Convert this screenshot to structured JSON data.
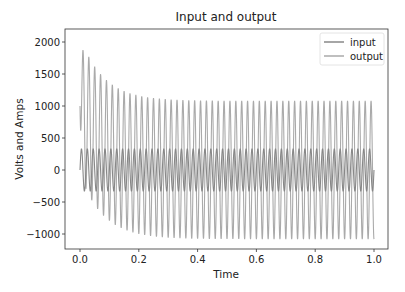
{
  "chart_data": {
    "type": "line",
    "title": "Input and output",
    "xlabel": "Time",
    "ylabel": "Volts and Amps",
    "xlim": [
      -0.05,
      1.05
    ],
    "ylim": [
      -1250,
      2200
    ],
    "xticks": [
      0.0,
      0.2,
      0.4,
      0.6,
      0.8,
      1.0
    ],
    "xtick_labels": [
      "0.0",
      "0.2",
      "0.4",
      "0.6",
      "0.8",
      "1.0"
    ],
    "yticks": [
      -1000,
      -500,
      0,
      500,
      1000,
      1500,
      2000
    ],
    "ytick_labels": [
      "−1000",
      "−500",
      "0",
      "500",
      "1000",
      "1500",
      "2000"
    ],
    "grid": false,
    "legend_position": "upper right",
    "frequency_hz": 50,
    "series": [
      {
        "name": "input",
        "color": "#888888",
        "description": "sinusoid amplitude ~330 centered at 0",
        "amplitude": 330,
        "offset": 0
      },
      {
        "name": "output",
        "color": "#aaaaaa",
        "description": "sinusoid amplitude ~1080 with decaying DC offset from ~1000 to ~0",
        "amplitude": 1080,
        "initial_offset": 1000,
        "decay_time_constant": 0.08,
        "peak_values_sample": [
          2060,
          1880,
          1740,
          1600,
          1510,
          1430,
          1360,
          1300,
          1250,
          1210,
          1170,
          1140,
          1120,
          1100,
          1090,
          1080
        ]
      }
    ]
  }
}
